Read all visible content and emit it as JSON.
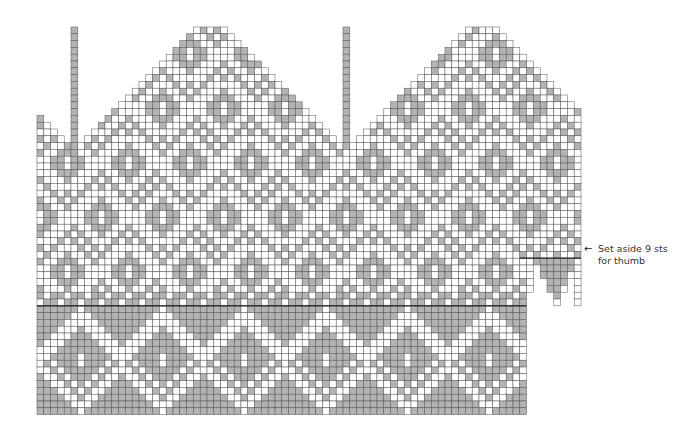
{
  "chart": {
    "type": "knitting-colorwork-chart",
    "cell_size": 6.8,
    "origin": [
      37,
      27
    ],
    "colors": {
      "background": "#ffffff",
      "contrast": "#b3b3b3",
      "grid": "#555555",
      "rule": "#222222"
    },
    "columns": 80,
    "rows": 57,
    "body_columns": 72,
    "column_tops": [
      13,
      14,
      15,
      16,
      17,
      0,
      17,
      16,
      15,
      14,
      13,
      12,
      11,
      10,
      9,
      8,
      7,
      6,
      5,
      4,
      3,
      2,
      1,
      0,
      0,
      0,
      0,
      0,
      1,
      2,
      3,
      4,
      5,
      6,
      7,
      8,
      9,
      10,
      11,
      12,
      13,
      14,
      15,
      16,
      17,
      0,
      17,
      16,
      15,
      14,
      13,
      12,
      11,
      10,
      9,
      8,
      7,
      6,
      5,
      4,
      3,
      2,
      1,
      0,
      0,
      0,
      0,
      0,
      1,
      2,
      3,
      4,
      5,
      6,
      7,
      8,
      9,
      10,
      11,
      12
    ],
    "column_bottoms_thumb": [
      56,
      56,
      56,
      56,
      56,
      56,
      56,
      56,
      56,
      56,
      56,
      56,
      56,
      56,
      56,
      56,
      56,
      56,
      56,
      56,
      56,
      56,
      56,
      56,
      56,
      56,
      56,
      56,
      56,
      56,
      56,
      56,
      56,
      56,
      56,
      56,
      56,
      56,
      56,
      56,
      56,
      56,
      56,
      56,
      56,
      56,
      56,
      56,
      56,
      56,
      56,
      56,
      56,
      56,
      56,
      56,
      56,
      56,
      56,
      56,
      56,
      56,
      56,
      56,
      56,
      56,
      56,
      56,
      56,
      56,
      56,
      56,
      38,
      34,
      36,
      38,
      40,
      38,
      36,
      40
    ],
    "solid_strips": [
      {
        "col": 5,
        "from": 0,
        "to": 17
      },
      {
        "col": 45,
        "from": 0,
        "to": 17
      }
    ],
    "band_rule_row": 41,
    "thumb_rule_row": 33,
    "cuff_start_row": 39
  },
  "annotation": {
    "arrow": "←",
    "line1": "Set aside 9 sts",
    "line2": "for thumb"
  }
}
